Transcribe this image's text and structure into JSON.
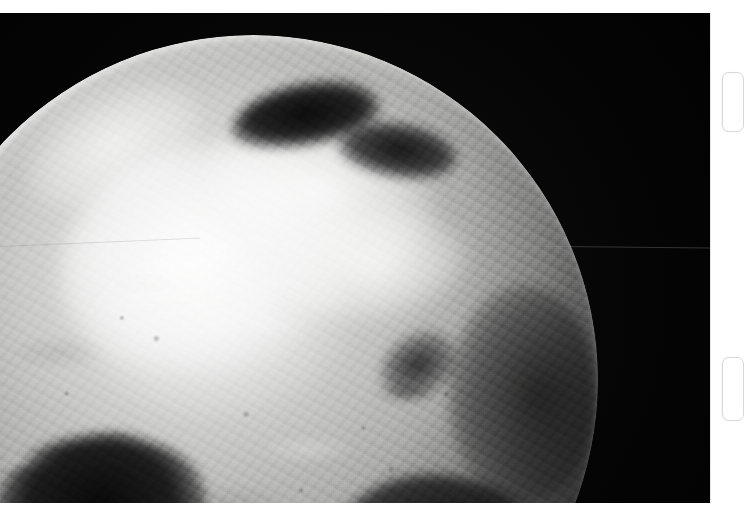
{
  "page": {
    "background_color": "#ffffff",
    "width": 736,
    "height": 528
  },
  "photo": {
    "subject": "Earth from space — North Polar / Arctic region",
    "capture_style": "grayscale satellite photograph",
    "alt_text": "Black and white photograph of Earth taken from space showing the Arctic ice cap, surrounding landmasses and cloud systems against the black of space, with the terminator falling away to the lower right",
    "space_color": "#030303",
    "highlight_color": "#f2f2f0",
    "midtone_color": "#a8a8a6",
    "shadow_color": "#121214",
    "frame": {
      "left": 0,
      "top": 13,
      "width": 710,
      "height": 490
    },
    "features": [
      {
        "name": "polar-ice-cap",
        "tone": "bright"
      },
      {
        "name": "open-sea-inlet-north",
        "tone": "dark"
      },
      {
        "name": "open-sea-inlet-northeast",
        "tone": "dark"
      },
      {
        "name": "coastal-landmass-southwest",
        "tone": "midtone"
      },
      {
        "name": "cloud-band-south",
        "tone": "bright"
      },
      {
        "name": "terminator-limb-east",
        "tone": "shadow"
      }
    ],
    "artifacts": [
      {
        "name": "film-scratch-left",
        "orientation": "horizontal"
      },
      {
        "name": "film-scratch-right",
        "orientation": "horizontal"
      }
    ]
  },
  "margin": {
    "card_edges": [
      {
        "name": "card-edge-top"
      },
      {
        "name": "card-edge-bottom"
      }
    ],
    "edge_color": "#d8d8d8"
  }
}
